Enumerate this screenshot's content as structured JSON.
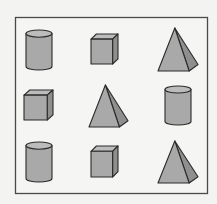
{
  "diagram": {
    "frame": {
      "x": 15,
      "y": 17,
      "width": 192,
      "height": 176,
      "stroke": "#4a4a4a"
    },
    "colors": {
      "background": "#f3f3f1",
      "frame_fill": "#f5f5f3",
      "shape_fill": "#a9a9a9",
      "shape_side": "#8f8f8f",
      "shape_top": "#bcbcbc",
      "outline": "#2b2b2b"
    },
    "rows": [
      {
        "row": 1,
        "shapes": [
          "cylinder",
          "cube",
          "pyramid"
        ]
      },
      {
        "row": 2,
        "shapes": [
          "cube",
          "pyramid",
          "cylinder"
        ]
      },
      {
        "row": 3,
        "shapes": [
          "cylinder",
          "cube",
          "pyramid"
        ]
      }
    ],
    "shapes": [
      {
        "id": "r1c1",
        "type": "cylinder",
        "x": 26,
        "y": 30,
        "w": 26,
        "h": 40
      },
      {
        "id": "r1c2",
        "type": "cube",
        "x": 91,
        "y": 34,
        "w": 27,
        "h": 30
      },
      {
        "id": "r1c3",
        "type": "pyramid",
        "x": 158,
        "y": 28,
        "w": 40,
        "h": 43
      },
      {
        "id": "r2c1",
        "type": "cube",
        "x": 24,
        "y": 90,
        "w": 29,
        "h": 30
      },
      {
        "id": "r2c2",
        "type": "pyramid",
        "x": 89,
        "y": 85,
        "w": 39,
        "h": 42
      },
      {
        "id": "r2c3",
        "type": "cylinder",
        "x": 165,
        "y": 86,
        "w": 26,
        "h": 39
      },
      {
        "id": "r3c1",
        "type": "cylinder",
        "x": 26,
        "y": 142,
        "w": 26,
        "h": 40
      },
      {
        "id": "r3c2",
        "type": "cube",
        "x": 91,
        "y": 146,
        "w": 27,
        "h": 31
      },
      {
        "id": "r3c3",
        "type": "pyramid",
        "x": 158,
        "y": 141,
        "w": 40,
        "h": 42
      }
    ]
  }
}
